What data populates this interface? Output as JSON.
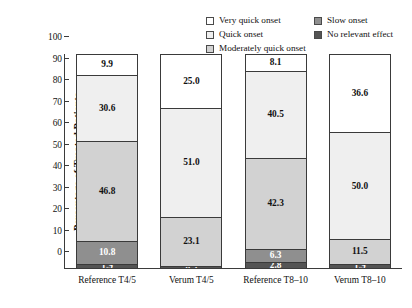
{
  "chart_data": {
    "type": "bar",
    "subtype": "stacked-bar-100",
    "title": "",
    "xlabel": "",
    "ylabel": "Percentage of Treated Patients",
    "ylim": [
      0,
      100
    ],
    "yticks": [
      0,
      10,
      20,
      30,
      40,
      50,
      60,
      70,
      80,
      90,
      100
    ],
    "grid": false,
    "legend_position": "top-right",
    "legend_columns": 2,
    "categories": [
      "Reference T4/5",
      "Verum T4/5",
      "Reference T8–10",
      "Verum T8–10"
    ],
    "stack_order_bottom_to_top": [
      "No relevant effect",
      "Slow onset",
      "Moderately quick onset",
      "Quick onset",
      "Very quick onset"
    ],
    "series": [
      {
        "name": "Very quick onset",
        "color": "#ffffff",
        "values": [
          9.9,
          25.0,
          8.1,
          36.6
        ]
      },
      {
        "name": "Quick onset",
        "color": "#efefef",
        "values": [
          30.6,
          51.0,
          40.5,
          50.0
        ]
      },
      {
        "name": "Moderately quick onset",
        "color": "#d2d2d2",
        "values": [
          46.8,
          23.1,
          42.3,
          11.5
        ]
      },
      {
        "name": "Slow onset",
        "color": "#8f8f8f",
        "values": [
          10.8,
          0.0,
          6.3,
          0.0
        ]
      },
      {
        "name": "No relevant effect",
        "color": "#545454",
        "values": [
          1.9,
          0.9,
          2.8,
          1.9
        ]
      }
    ]
  },
  "legend": {
    "left_column": [
      {
        "label": "Very quick onset",
        "color": "#ffffff"
      },
      {
        "label": "Quick onset",
        "color": "#efefef"
      },
      {
        "label": "Moderately quick onset",
        "color": "#d2d2d2"
      }
    ],
    "right_column": [
      {
        "label": "Slow onset",
        "color": "#8f8f8f"
      },
      {
        "label": "No relevant effect",
        "color": "#545454"
      }
    ]
  },
  "axis": {
    "y_title": "Percentage of Treated Patients",
    "y_tick_labels": [
      "100",
      "90",
      "80",
      "70",
      "60",
      "50",
      "40",
      "30",
      "20",
      "10",
      "0"
    ]
  },
  "bars": [
    {
      "category": "Reference T4/5",
      "segments": [
        {
          "series": "Very quick onset",
          "value": 9.9,
          "label": "9.9",
          "color": "#ffffff",
          "text_color": "#111111"
        },
        {
          "series": "Quick onset",
          "value": 30.6,
          "label": "30.6",
          "color": "#efefef",
          "text_color": "#111111"
        },
        {
          "series": "Moderately quick onset",
          "value": 46.8,
          "label": "46.8",
          "color": "#d2d2d2",
          "text_color": "#111111"
        },
        {
          "series": "Slow onset",
          "value": 10.8,
          "label": "10.8",
          "color": "#8f8f8f",
          "text_color": "#ffffff"
        },
        {
          "series": "No relevant effect",
          "value": 1.9,
          "label": "1.9",
          "color": "#545454",
          "text_color": "#ffffff"
        }
      ]
    },
    {
      "category": "Verum T4/5",
      "segments": [
        {
          "series": "Very quick onset",
          "value": 25.0,
          "label": "25.0",
          "color": "#ffffff",
          "text_color": "#111111"
        },
        {
          "series": "Quick onset",
          "value": 51.0,
          "label": "51.0",
          "color": "#efefef",
          "text_color": "#111111"
        },
        {
          "series": "Moderately quick onset",
          "value": 23.1,
          "label": "23.1",
          "color": "#d2d2d2",
          "text_color": "#111111"
        },
        {
          "series": "No relevant effect",
          "value": 0.9,
          "label": "0.9",
          "color": "#545454",
          "text_color": "#ffffff"
        }
      ]
    },
    {
      "category": "Reference T8–10",
      "segments": [
        {
          "series": "Very quick onset",
          "value": 8.1,
          "label": "8.1",
          "color": "#ffffff",
          "text_color": "#111111"
        },
        {
          "series": "Quick onset",
          "value": 40.5,
          "label": "40.5",
          "color": "#efefef",
          "text_color": "#111111"
        },
        {
          "series": "Moderately quick onset",
          "value": 42.3,
          "label": "42.3",
          "color": "#d2d2d2",
          "text_color": "#111111"
        },
        {
          "series": "Slow onset",
          "value": 6.3,
          "label": "6.3",
          "color": "#8f8f8f",
          "text_color": "#ffffff"
        },
        {
          "series": "No relevant effect",
          "value": 2.8,
          "label": "2.8",
          "color": "#545454",
          "text_color": "#ffffff"
        }
      ]
    },
    {
      "category": "Verum T8–10",
      "segments": [
        {
          "series": "Very quick onset",
          "value": 36.6,
          "label": "36.6",
          "color": "#ffffff",
          "text_color": "#111111"
        },
        {
          "series": "Quick onset",
          "value": 50.0,
          "label": "50.0",
          "color": "#efefef",
          "text_color": "#111111"
        },
        {
          "series": "Moderately quick onset",
          "value": 11.5,
          "label": "11.5",
          "color": "#d2d2d2",
          "text_color": "#111111"
        },
        {
          "series": "No relevant effect",
          "value": 1.9,
          "label": "1.9",
          "color": "#545454",
          "text_color": "#ffffff"
        }
      ]
    }
  ]
}
